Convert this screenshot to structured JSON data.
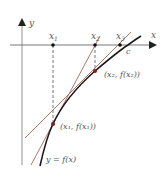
{
  "diagram": {
    "axes": {
      "x_label": "x",
      "y_label": "y"
    },
    "points_on_axis": [
      {
        "label": "x",
        "sub": "1"
      },
      {
        "label": "x",
        "sub": "2"
      },
      {
        "label": "x",
        "sub": "3"
      }
    ],
    "root_label": "c",
    "point_labels": {
      "p2": "(x₂, f(x₂))",
      "p1": "(x₁, f(x₁))"
    },
    "curve_label": "y = f(x)",
    "colors": {
      "curve": "#1a1a1a",
      "tangent": "#a0524a",
      "axis": "#333333",
      "point": "#8b1a1a"
    }
  }
}
